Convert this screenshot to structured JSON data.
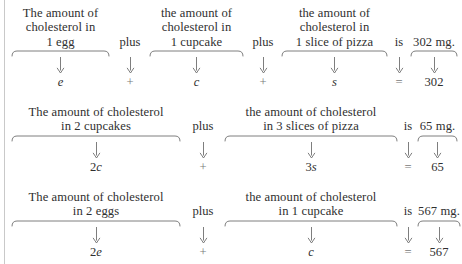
{
  "document": {
    "type": "math-word-problem-translation-diagram",
    "background_color": "#ffffff",
    "text_color": "#2f2f2f",
    "rule_color": "#c9c9c9"
  },
  "rows": [
    {
      "id": "row-1",
      "cells": [
        {
          "kind": "phrase",
          "lines": [
            "The amount of",
            "cholesterol in",
            "1 egg"
          ],
          "brace": true,
          "arrow": true,
          "term": "e",
          "term_style": "italic"
        },
        {
          "kind": "operator",
          "lines": [
            "plus"
          ],
          "brace": false,
          "arrow": true,
          "term": "+",
          "term_style": "symbol"
        },
        {
          "kind": "phrase",
          "lines": [
            "the amount of",
            "cholesterol in",
            "1 cupcake"
          ],
          "brace": true,
          "arrow": true,
          "term": "c",
          "term_style": "italic"
        },
        {
          "kind": "operator",
          "lines": [
            "plus"
          ],
          "brace": false,
          "arrow": true,
          "term": "+",
          "term_style": "symbol"
        },
        {
          "kind": "phrase",
          "lines": [
            "the amount of",
            "cholesterol in",
            "1 slice of pizza"
          ],
          "brace": true,
          "arrow": true,
          "term": "s",
          "term_style": "italic"
        },
        {
          "kind": "operator",
          "lines": [
            "is"
          ],
          "brace": false,
          "arrow": true,
          "term": "=",
          "term_style": "symbol"
        },
        {
          "kind": "result",
          "lines": [
            "302 mg."
          ],
          "brace": true,
          "arrow": true,
          "term": "302",
          "term_style": "plain"
        }
      ]
    },
    {
      "id": "row-2",
      "cells": [
        {
          "kind": "phrase",
          "lines": [
            "The amount of cholesterol",
            "in 2 cupcakes"
          ],
          "brace": true,
          "arrow": true,
          "term": "2c",
          "term_style": "coef-italic"
        },
        {
          "kind": "operator",
          "lines": [
            "plus"
          ],
          "brace": false,
          "arrow": true,
          "term": "+",
          "term_style": "symbol"
        },
        {
          "kind": "phrase",
          "lines": [
            "the amount of cholesterol",
            "in 3 slices of pizza"
          ],
          "brace": true,
          "arrow": true,
          "term": "3s",
          "term_style": "coef-italic"
        },
        {
          "kind": "operator",
          "lines": [
            "is"
          ],
          "brace": false,
          "arrow": true,
          "term": "=",
          "term_style": "symbol"
        },
        {
          "kind": "result",
          "lines": [
            "65 mg."
          ],
          "brace": true,
          "arrow": true,
          "term": "65",
          "term_style": "plain"
        }
      ]
    },
    {
      "id": "row-3",
      "cells": [
        {
          "kind": "phrase",
          "lines": [
            "The amount of cholesterol",
            "in 2 eggs"
          ],
          "brace": true,
          "arrow": true,
          "term": "2e",
          "term_style": "coef-italic"
        },
        {
          "kind": "operator",
          "lines": [
            "plus"
          ],
          "brace": false,
          "arrow": true,
          "term": "+",
          "term_style": "symbol"
        },
        {
          "kind": "phrase",
          "lines": [
            "the amount of cholesterol",
            "in 1 cupcake"
          ],
          "brace": true,
          "arrow": true,
          "term": "c",
          "term_style": "italic"
        },
        {
          "kind": "operator",
          "lines": [
            "is"
          ],
          "brace": false,
          "arrow": true,
          "term": "=",
          "term_style": "symbol"
        },
        {
          "kind": "result",
          "lines": [
            "567 mg."
          ],
          "brace": true,
          "arrow": true,
          "term": "567",
          "term_style": "plain"
        }
      ]
    }
  ],
  "layout": {
    "row_tops": [
      6,
      105,
      190
    ],
    "row_1_cells": [
      {
        "left": 11,
        "width": 99
      },
      {
        "left": 112,
        "width": 36
      },
      {
        "left": 149,
        "width": 95
      },
      {
        "left": 245,
        "width": 36
      },
      {
        "left": 281,
        "width": 107
      },
      {
        "left": 389,
        "width": 20
      },
      {
        "left": 410,
        "width": 48
      }
    ],
    "row_2_cells": [
      {
        "left": 11,
        "width": 170
      },
      {
        "left": 182,
        "width": 42
      },
      {
        "left": 224,
        "width": 174
      },
      {
        "left": 399,
        "width": 18
      },
      {
        "left": 417,
        "width": 41
      }
    ],
    "row_3_cells": [
      {
        "left": 11,
        "width": 170
      },
      {
        "left": 182,
        "width": 42
      },
      {
        "left": 224,
        "width": 174
      },
      {
        "left": 399,
        "width": 18
      },
      {
        "left": 417,
        "width": 44
      }
    ]
  }
}
